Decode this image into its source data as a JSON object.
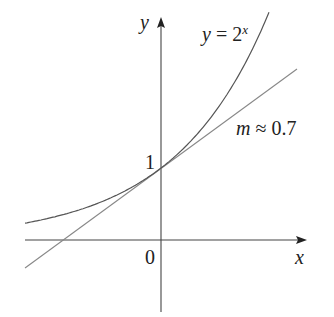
{
  "figure": {
    "curve_label_prefix": "y",
    "curve_label_eq": " = 2",
    "curve_label_exp": "x",
    "tangent_label_var": "m",
    "tangent_label_rest": " ≈ 0.7",
    "y_axis_label": "y",
    "x_axis_label": "x",
    "origin_label": "0",
    "y_intercept_label": "1"
  },
  "chart_data": {
    "type": "line",
    "title": "",
    "xlabel": "x",
    "ylabel": "y",
    "series": [
      {
        "name": "y = 2^x",
        "kind": "curve",
        "x_range": [
          -2.1,
          1.65
        ]
      },
      {
        "name": "tangent at (0,1), m ≈ 0.7",
        "kind": "line",
        "slope": 0.7,
        "intercept": 1,
        "x_range": [
          -2.1,
          2.1
        ]
      }
    ],
    "annotations": [
      "y = 2^x",
      "m ≈ 0.7",
      "1",
      "0"
    ],
    "grid": false,
    "colors": {
      "curve": "#555555",
      "tangent": "#888888",
      "axes": "#444444"
    }
  }
}
